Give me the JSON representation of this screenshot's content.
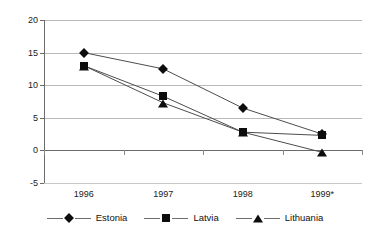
{
  "chart_data": {
    "type": "line",
    "title": "",
    "xlabel": "",
    "ylabel": "",
    "categories": [
      "1996",
      "1997",
      "1998",
      "1999*"
    ],
    "ylim": [
      -5,
      20
    ],
    "yticks": [
      20,
      15,
      10,
      5,
      0,
      -5
    ],
    "grid": true,
    "legend_position": "bottom",
    "series": [
      {
        "name": "Estonia",
        "marker": "diamond",
        "values": [
          15,
          12.5,
          6.5,
          2.5
        ]
      },
      {
        "name": "Latvia",
        "marker": "square",
        "values": [
          13,
          8.3,
          2.8,
          2.3
        ]
      },
      {
        "name": "Lithuania",
        "marker": "triangle",
        "values": [
          13,
          7.3,
          2.8,
          -0.3
        ]
      }
    ]
  },
  "legend": {
    "items": [
      {
        "label": "Estonia",
        "symbol": "diamond-marker"
      },
      {
        "label": "Latvia",
        "symbol": "square-marker"
      },
      {
        "label": "Lithuania",
        "symbol": "triangle-marker"
      }
    ]
  },
  "colors": {
    "marker": "#0d0d0d",
    "line": "#4d4d4d",
    "grid": "#b9b9b9",
    "axis": "#6b6b6b",
    "text": "#1a1a1a",
    "background": "#ffffff"
  }
}
